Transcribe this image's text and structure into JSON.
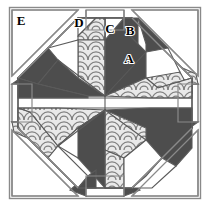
{
  "figure": {
    "kind": "quilt-block-diagram",
    "title": "",
    "width": 210,
    "height": 206,
    "background": "#ffffff"
  },
  "colors": {
    "dark": "#4d4d4d",
    "light": "#ffffff",
    "medium_texture_bg": "#e8e8e8",
    "medium_texture_arc": "#808080",
    "outline": "#555555",
    "label_text": "#000000",
    "frame": "#8a8a8a"
  },
  "labels": [
    {
      "id": "A",
      "text": "A",
      "x": 129,
      "y": 63,
      "patch": "dark-kite-center-right"
    },
    {
      "id": "B",
      "text": "B",
      "x": 130,
      "y": 35,
      "patch": "dark-tip-upper"
    },
    {
      "id": "C",
      "text": "C",
      "x": 110,
      "y": 33,
      "patch": "light-diamond-top"
    },
    {
      "id": "D",
      "text": "D",
      "x": 79,
      "y": 27,
      "patch": "light-triangle-upper-left"
    },
    {
      "id": "E",
      "text": "E",
      "x": 20,
      "y": 24,
      "patch": "light-corner-triangle"
    }
  ],
  "legend": {
    "entries": [
      {
        "name": "dark",
        "swatch": "#4d4d4d"
      },
      {
        "name": "light",
        "swatch": "#ffffff"
      },
      {
        "name": "medium-print",
        "swatch": "#e8e8e8"
      }
    ]
  }
}
